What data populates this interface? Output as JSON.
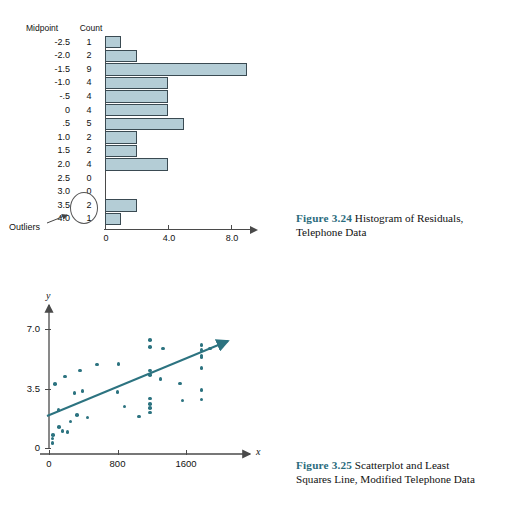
{
  "figures": [
    {
      "id": "3.24",
      "fignum": "Figure 3.24",
      "caption_line1": "Histogram of Residuals,",
      "caption_line2": "Telephone Data"
    },
    {
      "id": "3.25",
      "fignum": "Figure 3.25",
      "caption_line1": "Scatterplot and Least",
      "caption_line2": "Squares Line, Modified Telephone Data"
    }
  ],
  "histogram": {
    "header_midpoint": "Midpoint",
    "header_count": "Count",
    "outliers_label": "Outliers",
    "bar_fill": "#b4cdd6",
    "bar_stroke": "#3a4a52",
    "rows": [
      {
        "midpoint": "-2.5",
        "count": "1"
      },
      {
        "midpoint": "-2.0",
        "count": "2"
      },
      {
        "midpoint": "-1.5",
        "count": "9"
      },
      {
        "midpoint": "-1.0",
        "count": "4"
      },
      {
        "midpoint": "-.5",
        "count": "4"
      },
      {
        "midpoint": "0",
        "count": "4"
      },
      {
        "midpoint": ".5",
        "count": "5"
      },
      {
        "midpoint": "1.0",
        "count": "2"
      },
      {
        "midpoint": "1.5",
        "count": "2"
      },
      {
        "midpoint": "2.0",
        "count": "4"
      },
      {
        "midpoint": "2.5",
        "count": "0"
      },
      {
        "midpoint": "3.0",
        "count": "0"
      },
      {
        "midpoint": "3.5",
        "count": "2"
      },
      {
        "midpoint": "4.0",
        "count": "1"
      }
    ],
    "xticks": [
      "0",
      "4.0",
      "8.0"
    ]
  },
  "scatter": {
    "xlabel": "x",
    "ylabel": "y",
    "xticks": [
      "0",
      "800",
      "1600"
    ],
    "yticks": [
      "0",
      "3.5",
      "7.0"
    ],
    "line_annotation": "5",
    "dot_color": "#2c7380",
    "line_color": "#2c7380"
  },
  "chart_data": [
    {
      "type": "bar",
      "title": "Histogram of Residuals, Telephone Data",
      "orientation": "horizontal",
      "xlabel": "Count",
      "ylabel": "Midpoint",
      "categories": [
        "-2.5",
        "-2.0",
        "-1.5",
        "-1.0",
        "-.5",
        "0",
        ".5",
        "1.0",
        "1.5",
        "2.0",
        "2.5",
        "3.0",
        "3.5",
        "4.0"
      ],
      "values": [
        1,
        2,
        9,
        4,
        4,
        4,
        5,
        2,
        2,
        4,
        0,
        0,
        2,
        1
      ],
      "xlim": [
        0,
        9.4
      ],
      "xticks": [
        0,
        4.0,
        8.0
      ],
      "grid": false,
      "annotations": [
        {
          "text": "Outliers",
          "targets": [
            "3.5",
            "4.0"
          ],
          "note": "ellipse around counts 2 and 1"
        }
      ]
    },
    {
      "type": "scatter",
      "title": "Scatterplot and Least Squares Line, Modified Telephone Data",
      "xlabel": "x",
      "ylabel": "y",
      "xlim": [
        -120,
        2050
      ],
      "ylim": [
        -0.35,
        7.6
      ],
      "xticks": [
        0,
        800,
        1600
      ],
      "yticks": [
        0,
        3.5,
        7.0
      ],
      "grid": false,
      "legend": "none",
      "series": [
        {
          "name": "observations",
          "points": [
            [
              40,
              0.55
            ],
            [
              40,
              0.3
            ],
            [
              45,
              0.75
            ],
            [
              70,
              3.75
            ],
            [
              110,
              2.25
            ],
            [
              120,
              1.25
            ],
            [
              160,
              1.0
            ],
            [
              185,
              4.2
            ],
            [
              215,
              0.95
            ],
            [
              250,
              1.55
            ],
            [
              300,
              3.25
            ],
            [
              330,
              1.95
            ],
            [
              360,
              4.55
            ],
            [
              390,
              3.35
            ],
            [
              450,
              1.8
            ],
            [
              560,
              4.9
            ],
            [
              800,
              3.3
            ],
            [
              810,
              4.95
            ],
            [
              880,
              2.45
            ],
            [
              1050,
              1.85
            ],
            [
              1180,
              6.35
            ],
            [
              1180,
              5.95
            ],
            [
              1180,
              4.55
            ],
            [
              1180,
              4.3
            ],
            [
              1180,
              2.9
            ],
            [
              1180,
              2.6
            ],
            [
              1180,
              2.35
            ],
            [
              1180,
              2.1
            ],
            [
              1300,
              4.05
            ],
            [
              1330,
              5.85
            ],
            [
              1530,
              3.8
            ],
            [
              1560,
              2.8
            ],
            [
              1780,
              6.05
            ],
            [
              1780,
              5.75
            ],
            [
              1780,
              5.45
            ],
            [
              1780,
              5.35
            ],
            [
              1780,
              4.7
            ],
            [
              1780,
              3.4
            ],
            [
              1780,
              2.85
            ],
            [
              1880,
              5.85
            ]
          ]
        },
        {
          "name": "least squares line",
          "type": "line",
          "endpoints": [
            [
              -40,
              1.3
            ],
            [
              1980,
              6.05
            ]
          ],
          "annotation": "5"
        }
      ]
    }
  ]
}
